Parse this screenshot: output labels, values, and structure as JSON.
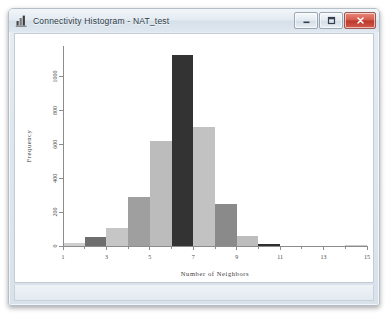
{
  "window": {
    "title": "Connectivity Histogram - NAT_test",
    "app_icon": "chart-app-icon",
    "controls": {
      "minimize": "─",
      "maximize": "□",
      "close": "✕"
    }
  },
  "chart_data": {
    "type": "bar",
    "title": "",
    "xlabel": "Number of Neighbors",
    "ylabel": "Frequency",
    "categories": [
      1,
      2,
      3,
      4,
      5,
      6,
      7,
      8,
      9,
      10,
      11,
      12,
      13,
      14
    ],
    "values": [
      18,
      55,
      105,
      290,
      620,
      1125,
      700,
      250,
      60,
      12,
      0,
      0,
      0,
      3
    ],
    "bar_colors": [
      "#cfcfcf",
      "#6e6e6e",
      "#c6c6c6",
      "#9f9f9f",
      "#bcbcbc",
      "#333333",
      "#c2c2c2",
      "#8a8a8a",
      "#bdbdbd",
      "#2f2f2f",
      "#d2d2d2",
      "#d2d2d2",
      "#d2d2d2",
      "#c9c9c9"
    ],
    "xticks": [
      1,
      3,
      5,
      7,
      9,
      11,
      13,
      15
    ],
    "yticks": [
      0,
      200,
      400,
      600,
      800,
      1000
    ],
    "xlim": [
      1,
      15
    ],
    "ylim": [
      0,
      1180
    ],
    "grid": false,
    "legend": null,
    "axis_color": "#8c8c8c",
    "background": "#ffffff"
  }
}
